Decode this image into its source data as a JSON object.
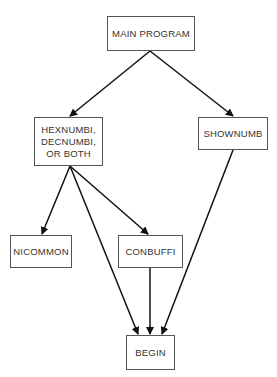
{
  "diagram": {
    "type": "call-hierarchy",
    "nodes": [
      {
        "id": "main",
        "label": "MAIN PROGRAM"
      },
      {
        "id": "hex",
        "label": "HEXNUMBI,\nDECNUMBI,\nOR BOTH"
      },
      {
        "id": "shownumb",
        "label": "SHOWNUMB"
      },
      {
        "id": "nicommon",
        "label": "NICOMMON"
      },
      {
        "id": "conbuffi",
        "label": "CONBUFFI"
      },
      {
        "id": "begin",
        "label": "BEGIN"
      }
    ],
    "edges": [
      {
        "from": "main",
        "to": "hex"
      },
      {
        "from": "main",
        "to": "shownumb"
      },
      {
        "from": "hex",
        "to": "nicommon"
      },
      {
        "from": "hex",
        "to": "conbuffi"
      },
      {
        "from": "hex",
        "to": "begin"
      },
      {
        "from": "conbuffi",
        "to": "begin"
      },
      {
        "from": "shownumb",
        "to": "begin"
      }
    ],
    "colors": {
      "line": "#111111",
      "border": "#555555",
      "text": "#333333"
    }
  }
}
